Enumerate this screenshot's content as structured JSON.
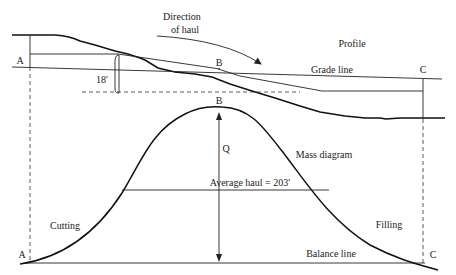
{
  "labels": {
    "direction_of_haul_line1": "Direction",
    "direction_of_haul_line2": "of haul",
    "profile": "Profile",
    "grade_line": "Grade line",
    "point_a_top": "A",
    "point_b_top": "B",
    "point_c_top": "C",
    "depth": "18'",
    "point_b_mass": "B",
    "q": "Q",
    "mass_diagram": "Mass diagram",
    "average_haul": "Average haul = 203'",
    "cutting": "Cutting",
    "filling": "Filling",
    "balance_line": "Balance line",
    "point_a_bottom": "A",
    "point_c_bottom": "C"
  },
  "colors": {
    "line": "#222222",
    "background": "#ffffff"
  }
}
